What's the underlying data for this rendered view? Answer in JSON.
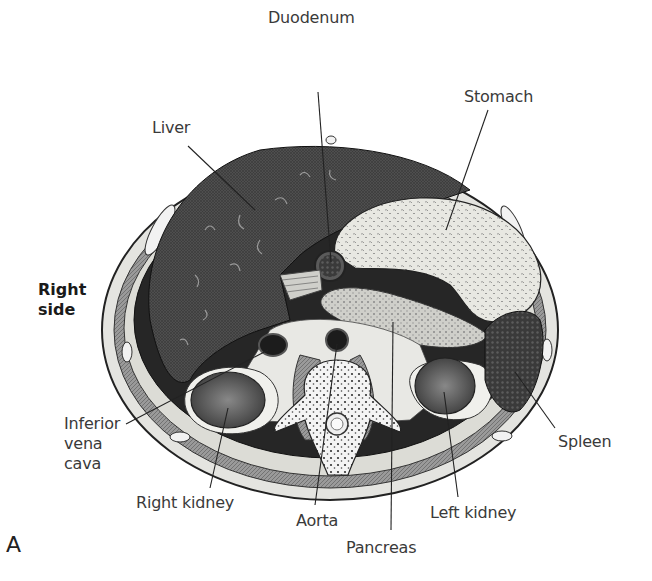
{
  "figure": {
    "panel_label": "A",
    "orientation_label": [
      "Right",
      "side"
    ],
    "labels": {
      "duodenum": "Duodenum",
      "stomach": "Stomach",
      "liver": "Liver",
      "ivc": [
        "Inferior",
        "vena",
        "cava"
      ],
      "spleen": "Spleen",
      "right_kidney": "Right kidney",
      "aorta": "Aorta",
      "left_kidney": "Left kidney",
      "pancreas": "Pancreas"
    },
    "colors": {
      "liver_fill": "#4a4a4a",
      "cavity_fill": "#2a2a2a",
      "stomach_fill": "#e6e6e0",
      "pancreas_fill": "#c8c8c4",
      "bone_fill": "#f2f2f2",
      "muscle_fill": "#8a8a8a",
      "kidney_fill": "#6a6a6a",
      "label_color": "#3a3a3a"
    }
  }
}
